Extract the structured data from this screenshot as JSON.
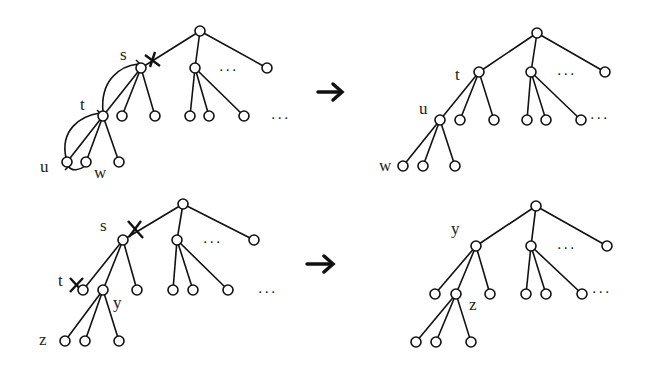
{
  "diagram": {
    "panels": [
      {
        "id": "top-before",
        "labels": {
          "s": "s",
          "t": "t",
          "u": "u",
          "w": "w"
        },
        "ellipsis": [
          "...",
          "..."
        ],
        "cut_marks": 1
      },
      {
        "id": "top-after",
        "labels": {
          "t": "t",
          "u": "u",
          "w": "w"
        },
        "ellipsis": [
          "...",
          "..."
        ]
      },
      {
        "id": "bottom-before",
        "labels": {
          "s": "s",
          "t": "t",
          "y": "y",
          "z": "z"
        },
        "ellipsis": [
          "...",
          "..."
        ],
        "cut_marks": 2
      },
      {
        "id": "bottom-after",
        "labels": {
          "y": "y",
          "z": "z"
        },
        "ellipsis": [
          "...",
          "..."
        ]
      }
    ],
    "arrows": [
      "→",
      "→"
    ],
    "colors": {
      "ink": "#111111",
      "background": "#ffffff"
    }
  }
}
